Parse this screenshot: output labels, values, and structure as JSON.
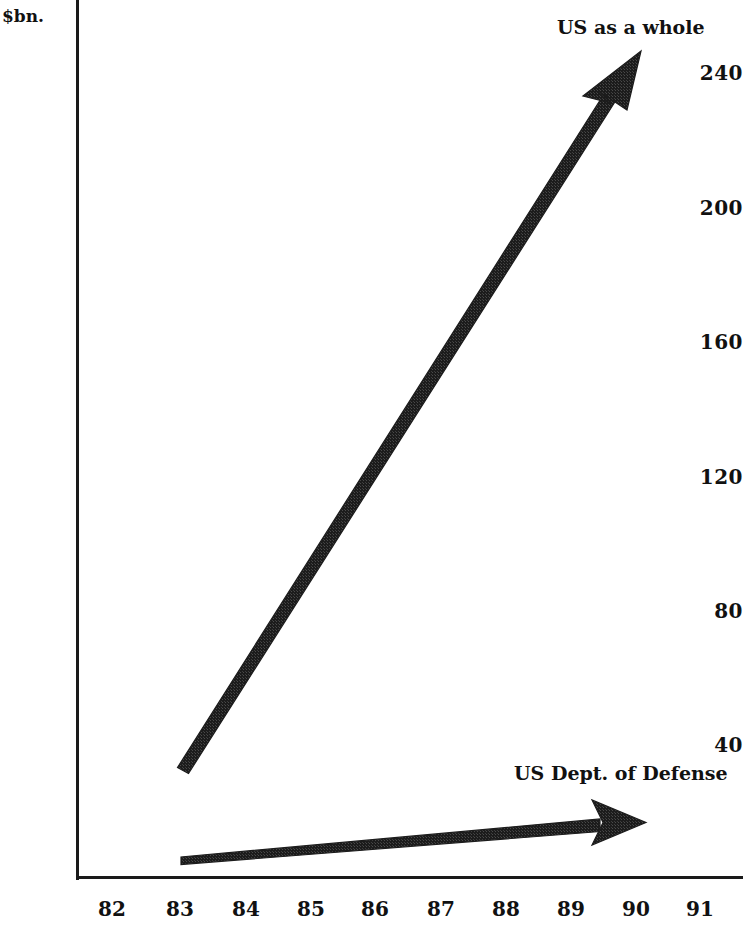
{
  "chart_data": {
    "type": "line",
    "title": "",
    "subtitle": "",
    "xlabel": "",
    "ylabel": "$bn.",
    "x_tick_labels": [
      "82",
      "83",
      "84",
      "85",
      "86",
      "87",
      "88",
      "89",
      "90",
      "91"
    ],
    "y_tick_labels": [
      "240",
      "200",
      "160",
      "120",
      "80",
      "40"
    ],
    "y_tick_values": [
      240,
      200,
      160,
      120,
      80,
      40
    ],
    "xlim": [
      82,
      91
    ],
    "ylim": [
      0,
      250
    ],
    "grid": false,
    "legend_position": "inline-annotations-right",
    "style_note": "two bold tapered arrows drawn as trend indicators, hand-drawn halftone texture",
    "series": [
      {
        "name": "US as a whole",
        "marker_label_position": "top-right",
        "x": [
          83,
          90.1
        ],
        "values": [
          40,
          250
        ],
        "x_labels": [
          "83",
          "90"
        ]
      },
      {
        "name": "US Dept. of Defense",
        "marker_label_position": "bottom-right",
        "x": [
          83,
          90.2
        ],
        "values": [
          5,
          17
        ],
        "x_labels": [
          "83",
          "90"
        ]
      }
    ],
    "annotations": [
      {
        "text": "US as a whole",
        "target_series": "US as a whole"
      },
      {
        "text": "US Dept. of Defense",
        "target_series": "US Dept. of Defense"
      }
    ]
  },
  "axes": {
    "y_title": "$bn.",
    "y_ticks": [
      {
        "label": "240",
        "top_px": 73
      },
      {
        "label": "200",
        "top_px": 208
      },
      {
        "label": "160",
        "top_px": 342
      },
      {
        "label": "120",
        "top_px": 477
      },
      {
        "label": "80",
        "top_px": 611
      },
      {
        "label": "40",
        "top_px": 745
      }
    ],
    "x_ticks": [
      {
        "label": "82",
        "left_px": 112
      },
      {
        "label": "83",
        "left_px": 180
      },
      {
        "label": "84",
        "left_px": 246
      },
      {
        "label": "85",
        "left_px": 311
      },
      {
        "label": "86",
        "left_px": 375
      },
      {
        "label": "87",
        "left_px": 441
      },
      {
        "label": "88",
        "left_px": 506
      },
      {
        "label": "89",
        "left_px": 571
      },
      {
        "label": "90",
        "left_px": 636
      },
      {
        "label": "91",
        "left_px": 700
      }
    ]
  },
  "labels": {
    "us_whole": "US as a whole",
    "us_dod": "US Dept. of Defense"
  },
  "colors": {
    "ink": "#1a1a1a",
    "text": "#111111",
    "background": "#ffffff"
  }
}
